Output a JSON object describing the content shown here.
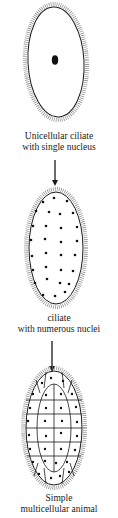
{
  "diagram": {
    "stages": [
      {
        "id": "unicellular",
        "caption_line1": "Unicellular ciliate",
        "caption_line2": "with single nucleus",
        "nuclei_count": 1
      },
      {
        "id": "multinucleate",
        "caption_line1": "ciliate",
        "caption_line2": "with numerous nuclei",
        "nuclei_count": 30
      },
      {
        "id": "multicellular",
        "caption_line1": "Simple",
        "caption_line2": "multicellular animal",
        "cell_count": 34
      }
    ],
    "arrows": [
      {
        "from": "unicellular",
        "to": "multinucleate"
      },
      {
        "from": "multinucleate",
        "to": "multicellular"
      }
    ],
    "colors": {
      "line": "#1a1a1a",
      "cilia": "#555555",
      "background": "#ffffff"
    }
  }
}
